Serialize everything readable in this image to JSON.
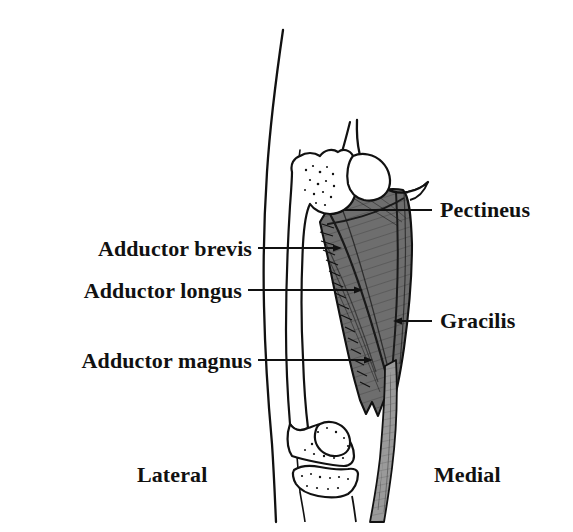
{
  "figure": {
    "background_color": "#ffffff",
    "width": 573,
    "height": 532,
    "ink_color": "#111111",
    "muscle_fill_color": "#6e6e6e",
    "gracilis_fill_color": "#9a9a9a",
    "bone_fill_color": "#ffffff"
  },
  "labels": {
    "pectineus": "Pectineus",
    "adductor_brevis": "Adductor brevis",
    "adductor_longus": "Adductor longus",
    "adductor_magnus": "Adductor magnus",
    "gracilis": "Gracilis"
  },
  "orientation": {
    "lateral": "Lateral",
    "medial": "Medial"
  },
  "callouts": [
    {
      "id": "pectineus",
      "label": "Pectineus",
      "side": "right",
      "line_y": 210,
      "line_x_start": 345,
      "line_x_end": 432,
      "text_x": 440,
      "text_y": 198
    },
    {
      "id": "adductor-brevis",
      "label": "Adductor brevis",
      "side": "left",
      "line_y": 248,
      "line_x_start": 258,
      "line_x_end": 341,
      "text_x": 52,
      "text_y": 236
    },
    {
      "id": "adductor-longus",
      "label": "Adductor longus",
      "side": "left",
      "line_y": 290,
      "line_x_start": 248,
      "line_x_end": 362,
      "text_x": 44,
      "text_y": 278
    },
    {
      "id": "gracilis",
      "label": "Gracilis",
      "side": "right",
      "line_y": 321,
      "line_x_start": 394,
      "line_x_end": 432,
      "text_x": 440,
      "text_y": 309
    },
    {
      "id": "adductor-magnus",
      "label": "Adductor magnus",
      "side": "left",
      "line_y": 360,
      "line_x_start": 258,
      "line_x_end": 372,
      "text_x": 32,
      "text_y": 348
    }
  ],
  "orientation_markers": [
    {
      "id": "lateral",
      "label": "Lateral",
      "text_x": 137,
      "text_y": 463
    },
    {
      "id": "medial",
      "label": "Medial",
      "text_x": 434,
      "text_y": 463
    }
  ],
  "anatomy_parts": [
    "leg-outer-contour",
    "femur-shaft",
    "greater-trochanter",
    "femoral-head-neck",
    "pubic-ramus",
    "groin-crease",
    "patella",
    "femoral-condyles",
    "tibial-plateau",
    "adductor-muscle-mass",
    "gracilis-strip"
  ]
}
